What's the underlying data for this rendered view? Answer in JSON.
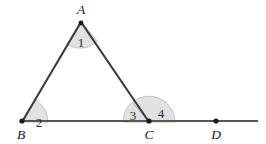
{
  "figure": {
    "kind": "geometry-diagram",
    "colors": {
      "background": "#ffffff",
      "stroke": "#3a3a3a",
      "base_line": "#56565a",
      "sector_fill": "#e2e2e2",
      "sector_stroke": "#b9b9b9",
      "label_text": "#1a1a1a",
      "angle_text": "#2a2a2a",
      "vertex_dot": "#1a1a1a"
    },
    "points": [
      {
        "id": "A",
        "label": "A",
        "x": 81,
        "y": 22,
        "dot": false,
        "label_x": 81,
        "label_y": 14
      },
      {
        "id": "B",
        "label": "B",
        "x": 22,
        "y": 122,
        "dot": true,
        "label_x": 21,
        "label_y": 139
      },
      {
        "id": "C",
        "label": "C",
        "x": 149,
        "y": 122,
        "dot": true,
        "label_x": 149,
        "label_y": 139
      },
      {
        "id": "D",
        "label": "D",
        "x": 216,
        "y": 121,
        "dot": true,
        "label_x": 216,
        "label_y": 139
      }
    ],
    "segments": [
      {
        "id": "AB",
        "from": "A",
        "to": "B",
        "x1": 81,
        "y1": 22,
        "x2": 22,
        "y2": 122
      },
      {
        "id": "AC",
        "from": "A",
        "to": "C",
        "x1": 81,
        "y1": 22,
        "x2": 149,
        "y2": 122
      },
      {
        "id": "BD",
        "from": "B",
        "to": "line-end",
        "x1": 22,
        "y1": 121,
        "x2": 258,
        "y2": 121
      }
    ],
    "angles": [
      {
        "id": "angle-1",
        "label": "1",
        "vertex": "A",
        "radius": 24,
        "label_x": 81,
        "label_y": 47,
        "path": "M 81 22 L 66.9 44.3 A 24 24 0 0 0 97.3 41.0 Z"
      },
      {
        "id": "angle-2",
        "label": "2",
        "vertex": "B",
        "radius": 26,
        "label_x": 39,
        "label_y": 127,
        "path": "M 22 122 L 48 122 A 26 26 0 0 0 35.3 100.0 Z"
      },
      {
        "id": "angle-3",
        "label": "3",
        "vertex": "C",
        "radius": 26,
        "label_x": 133,
        "label_y": 120,
        "path": "M 149 122 L 123 122 A 26 26 0 0 1 132.3 102.2 Z"
      },
      {
        "id": "angle-4",
        "label": "4",
        "vertex": "C",
        "radius": 26,
        "label_x": 161,
        "label_y": 118,
        "path": "M 149 122 L 132.3 102.2 A 26 26 0 0 1 175 122 Z"
      }
    ]
  }
}
